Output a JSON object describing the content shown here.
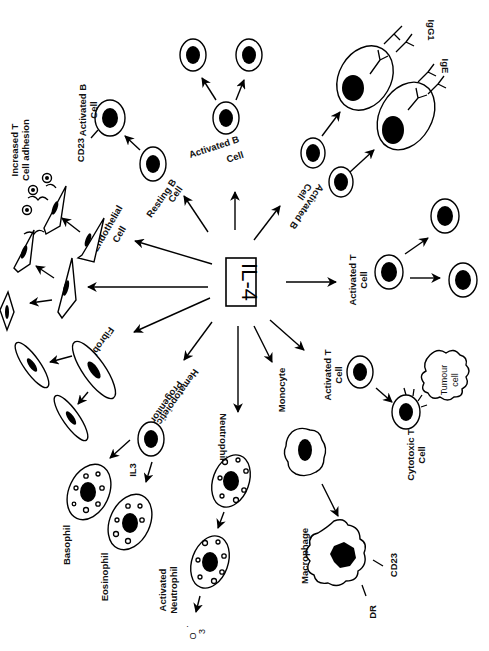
{
  "figure": {
    "title": "IL-4",
    "orientation": "rotated 90 degrees clockwise",
    "center": {
      "label": "IL-4"
    },
    "targets": [
      {
        "id": "resting-b-cell",
        "label": "Resting B Cell",
        "effect": {
          "label": "Activated B Cell",
          "marker": "CD23"
        }
      },
      {
        "id": "activated-b-cell-prolif",
        "label": "Activated B Cell",
        "effect": {
          "label": "proliferation"
        }
      },
      {
        "id": "activated-b-cell-ig",
        "label": "Activated B Cell",
        "effect": {
          "antibodies": [
            "IgG1",
            "IgE"
          ]
        }
      },
      {
        "id": "activated-t-cell-prolif",
        "label": "Activated T Cell",
        "effect": {
          "label": "proliferation"
        }
      },
      {
        "id": "activated-t-cell-ctl",
        "label": "Activated T Cell",
        "effect": {
          "label": "Cytotoxic T Cell",
          "target": "Tumour cell"
        }
      },
      {
        "id": "monocyte",
        "label": "Monocyte",
        "effect": {
          "label": "Macrophage",
          "markers": [
            "CD23",
            "DR"
          ]
        }
      },
      {
        "id": "neutrophil",
        "label": "Neutrophil",
        "effect": {
          "label": "Activated Neutrophil",
          "product": "O3-"
        }
      },
      {
        "id": "hematopoietic-progenitor",
        "label": "Hematopoietic Progenitor",
        "cofactor": "IL3",
        "effect": {
          "outputs": [
            "Basophil",
            "Eosinophil"
          ]
        }
      },
      {
        "id": "fibroblast",
        "label": "Fibroblast",
        "effect": {
          "label": "proliferation"
        }
      },
      {
        "id": "fibroblast-2",
        "label": "",
        "effect": {
          "label": "proliferation"
        }
      },
      {
        "id": "endothelial-cell",
        "label": "Endothelial Cell",
        "effect": {
          "label": "Increased T Cell adhesion"
        }
      }
    ]
  },
  "labels": {
    "center": "IL-4",
    "activated_b_cell_top_1": "Activated B",
    "activated_b_cell_top_2": "Cell",
    "cd23_b": "CD23",
    "increased_t_1": "Increased T",
    "increased_t_2": "Cell  adhesion",
    "resting_b_1": "Resting B",
    "resting_b_2": "Cell",
    "activated_b_mid_1": "Activated B",
    "activated_b_mid_2": "Cell",
    "activated_b_right_1": "Activated B",
    "activated_b_right_2": "Cell",
    "igg1": "IgG1",
    "ige": "IgE",
    "endothelial_1": "Endothelial",
    "endothelial_2": "Cell",
    "activated_t_1_a": "Activated T",
    "activated_t_1_b": "Cell",
    "activated_t_2_a": "Activated T",
    "activated_t_2_b": "Cell",
    "tumour_1": "Tumour",
    "tumour_2": "cell",
    "cytotoxic_1": "Cytotoxic T",
    "cytotoxic_2": "Cell",
    "fibroblast": "Fibroblast",
    "hemato_1": "Hematopoietic",
    "hemato_2": "Progenitor",
    "il3": "IL3",
    "neutrophil": "Neutrophil",
    "monocyte": "Monocyte",
    "macrophage": "Macrophage",
    "cd23_mac": "CD23",
    "dr": "DR",
    "basophil": "Basophil",
    "eosinophil": "Eosinophil",
    "act_neut_1": "Activated",
    "act_neut_2": "Neutrophil",
    "o3_main": "O",
    "o3_sub": "3",
    "o3_sup": "·"
  }
}
